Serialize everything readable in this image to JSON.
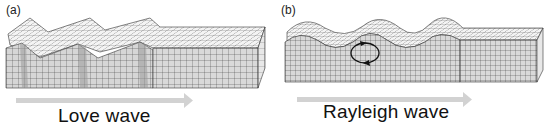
{
  "figure": {
    "panels": [
      {
        "id": "a",
        "label": "(a)",
        "caption": "Love wave",
        "wave_type": "love",
        "motion": "horizontal shear, transverse to propagation",
        "direction_arrow": "propagation-right"
      },
      {
        "id": "b",
        "label": "(b)",
        "caption": "Rayleigh wave",
        "wave_type": "rayleigh",
        "motion": "retrograde elliptical particle orbit",
        "direction_arrow": "propagation-right"
      }
    ],
    "colors": {
      "grid_line": "#333333",
      "block_face": "#d9d9d9",
      "block_top": "#f2f2f2",
      "arrow": "#d0d0d0",
      "text": "#111111"
    }
  }
}
